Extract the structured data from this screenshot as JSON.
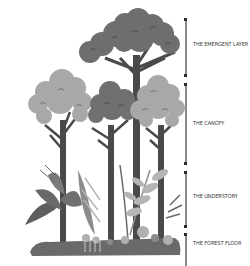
{
  "diagram": {
    "type": "rainforest-layers",
    "layers": [
      {
        "label": "THE EMERGENT LAYER",
        "bracket_top": 18,
        "bracket_bottom": 77,
        "label_y": 44
      },
      {
        "label": "THE CANOPY",
        "bracket_top": 83,
        "bracket_bottom": 165,
        "label_y": 123
      },
      {
        "label": "THE UNDERSTORY",
        "bracket_top": 171,
        "bracket_bottom": 228,
        "label_y": 195
      },
      {
        "label": "THE FOREST FLOOR",
        "bracket_top": 233,
        "bracket_bottom": 266,
        "label_y": 242
      }
    ],
    "colors": {
      "trunk": "#4a4a4a",
      "emergent_crown": "#6e6e6e",
      "canopy_light": "#a8a8a8",
      "canopy_dark": "#707070",
      "foliage_mid": "#8c8c8c",
      "foliage_light": "#b5b5b5",
      "ground": "#6a6a6a",
      "bracket": "#8a8a8a"
    }
  }
}
